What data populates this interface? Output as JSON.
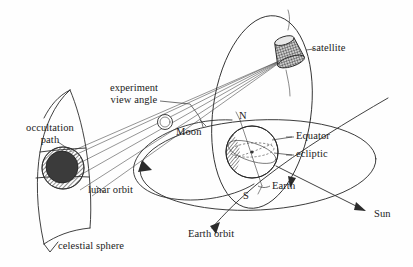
{
  "figure": {
    "type": "schematic-diagram",
    "background_color": "#fefefe",
    "ink_color": "#2b2b2b"
  },
  "labels": {
    "satellite": "satellite",
    "experiment_view_angle_line1": "experiment",
    "experiment_view_angle_line2": "view angle",
    "moon": "Moon",
    "occultation_path_line1": "occultation",
    "occultation_path_line2": "path",
    "lunar_orbit": "lunar orbit",
    "celestial_sphere": "celestial sphere",
    "north_pole": "N",
    "south_pole": "S",
    "equator": "Equator",
    "ecliptic": "ecliptic",
    "earth": "Earth",
    "earth_orbit": "Earth orbit",
    "sun": "Sun"
  },
  "elements": {
    "occultation_disk": {
      "name": "occulting-body-disk",
      "fill": "#3b3b3b",
      "ring": "hatched"
    },
    "moon_body": {
      "name": "moon-circle",
      "fill": "#ffffff"
    },
    "earth_body": {
      "name": "earth-globe",
      "fill": "#ffffff",
      "terminator": "hatched-crescent-left"
    },
    "satellite_body": {
      "name": "satellite-drum",
      "texture": "cross-hatch"
    },
    "orbits": [
      "satellite orbit (tall ellipse about Earth)",
      "lunar orbit (wide ellipse, arrow counter-clockwise)",
      "ecliptic plane (large wide ellipse)",
      "Earth orbit (diagonal line with arrow)"
    ],
    "view_rays": "fan of sight lines from satellite past Moon limb onto celestial sphere"
  },
  "caption_ghost": "Figure 1. Occultation viewing geometry"
}
